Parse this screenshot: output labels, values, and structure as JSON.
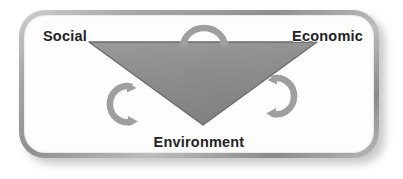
{
  "diagram": {
    "shape": "inverted-triangle",
    "frame": {
      "style": "beveled-rounded-rectangle",
      "border_color": "#9e9e9e",
      "fill_color": "#fdfdfd"
    },
    "triangle": {
      "fill_color": "#8d8d8d",
      "stroke_color": "#6f6f6f",
      "orientation": "point-down"
    },
    "nodes": [
      {
        "id": "social",
        "label": "Social",
        "position": "top-left"
      },
      {
        "id": "economic",
        "label": "Economic",
        "position": "top-right"
      },
      {
        "id": "environment",
        "label": "Environment",
        "position": "bottom-center"
      }
    ],
    "arrows": [
      {
        "id": "arc-top",
        "name": "top-curved-arrow",
        "between": "Social ↔ Economic",
        "color": "#9e9e9e"
      },
      {
        "id": "arc-left",
        "name": "left-curved-arrow",
        "between": "Social ↔ Environment",
        "color": "#9e9e9e"
      },
      {
        "id": "arc-right",
        "name": "right-curved-arrow",
        "between": "Economic ↔ Environment",
        "color": "#9e9e9e"
      }
    ],
    "colors": {
      "label_text": "#242424",
      "triangle": "#8d8d8d",
      "arc": "#9e9e9e",
      "frame_bevel": "#a9a9a9",
      "background": "#ffffff"
    }
  }
}
